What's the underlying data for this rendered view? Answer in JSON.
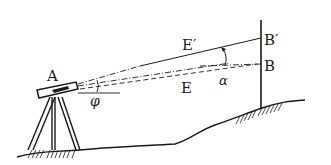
{
  "diagram": {
    "type": "surveying-leveling-sketch",
    "labels": {
      "A": "A",
      "B": "B",
      "B_prime": "B′",
      "E": "E",
      "E_prime": "E′",
      "phi": "φ",
      "alpha": "α"
    },
    "colors": {
      "ink": "#1a1a1a",
      "background": "#ffffff"
    }
  }
}
